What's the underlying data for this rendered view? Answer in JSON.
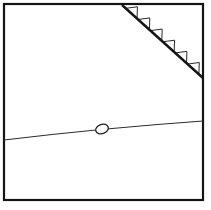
{
  "figure": {
    "title": "Structural geology map sketch",
    "background_color": "#ffffff",
    "ink_color": "#1a1a1a",
    "width": 211,
    "height": 210
  },
  "frame": {
    "name": "map-frame",
    "x": 4,
    "y": 4,
    "width": 199,
    "height": 196,
    "stroke": "#141414",
    "stroke_width": 2.2
  },
  "thrust_fault": {
    "label": "thrust-fault-line",
    "stroke": "#141414",
    "stroke_width": 2.4,
    "start": [
      122,
      5
    ],
    "end": [
      203,
      78
    ],
    "teeth_count": 6,
    "teeth_side": "upper-right",
    "teeth_size": 9,
    "teeth_stroke": "#2a2a2a",
    "teeth_stroke_width": 1.0,
    "teeth_fill": "#ffffff"
  },
  "fold_axis": {
    "label": "fold-axis-curve",
    "stroke": "#2b2b2b",
    "stroke_width": 1.1,
    "start": [
      4,
      140
    ],
    "control": [
      104,
      128
    ],
    "end": [
      203,
      121
    ]
  },
  "dome_symbol": {
    "label": "dome-ellipse-symbol",
    "center_x": 102,
    "center_y": 129,
    "radius_x": 6.5,
    "radius_y": 4.6,
    "rotation_deg": -18,
    "stroke": "#1f1f1f",
    "stroke_width": 1.3,
    "fill": "#ffffff"
  }
}
